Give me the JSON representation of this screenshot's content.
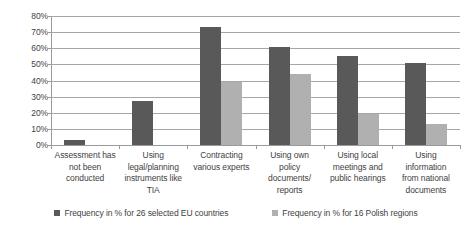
{
  "chart_data": {
    "type": "bar",
    "title": "",
    "xlabel": "",
    "ylabel": "",
    "ylim": [
      0,
      80
    ],
    "grid": true,
    "legend_position": "bottom",
    "ytick_labels": [
      "80%",
      "70%",
      "60%",
      "50%",
      "40%",
      "30%",
      "20%",
      "10%",
      "0%"
    ],
    "ytick_values": [
      80,
      70,
      60,
      50,
      40,
      30,
      20,
      10,
      0
    ],
    "categories": [
      "Assessment has not been conducted",
      "Using legal/planning instruments like TIA",
      "Contracting various experts",
      "Using own policy documents/ reports",
      "Using local meetings and public hearings",
      "Using information from national documents"
    ],
    "category_lines": [
      [
        "Assessment has",
        "not been",
        "conducted"
      ],
      [
        "Using",
        "legal/planning",
        "instruments like",
        "TIA"
      ],
      [
        "Contracting",
        "various experts"
      ],
      [
        "Using own",
        "policy",
        "documents/",
        "reports"
      ],
      [
        "Using local",
        "meetings and",
        "public hearings"
      ],
      [
        "Using",
        "information",
        "from national",
        "documents"
      ]
    ],
    "series": [
      {
        "name": "Frequency in % for 26 selected EU countries",
        "color": "#595959",
        "values": [
          3,
          27,
          73,
          61,
          55,
          51
        ]
      },
      {
        "name": "Frequency in % for 16 Polish regions",
        "color": "#b0b0b0",
        "values": [
          0,
          0,
          39,
          44,
          19,
          13
        ]
      }
    ]
  },
  "legend": {
    "items": [
      {
        "label": "Frequency in % for 26 selected EU countries",
        "color": "#595959"
      },
      {
        "label": "Frequency in % for 16 Polish regions",
        "color": "#b0b0b0"
      }
    ]
  }
}
